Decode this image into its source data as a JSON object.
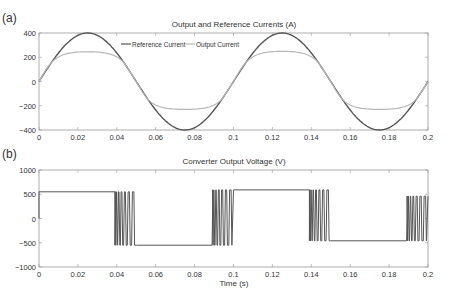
{
  "chart_data": [
    {
      "panel_label": "(a)",
      "type": "line",
      "title": "Output and Reference Currents (A)",
      "xlabel": "",
      "ylabel": "",
      "xlim": [
        0,
        0.2
      ],
      "ylim": [
        -400,
        400
      ],
      "xticks": [
        0,
        0.02,
        0.04,
        0.06,
        0.08,
        0.1,
        0.12,
        0.14,
        0.16,
        0.18,
        0.2
      ],
      "xtick_labels": [
        "0",
        "0.02",
        "0.04",
        "0.06",
        "0.08",
        "0.1",
        "0.12",
        "0.14",
        "0.16",
        "0.18",
        "0.2"
      ],
      "yticks": [
        400,
        200,
        0,
        -200,
        -400
      ],
      "ytick_labels": [
        "400",
        "200",
        "0",
        "−200",
        "−400"
      ],
      "grid": false,
      "legend_position": "upper-left-inside",
      "series": [
        {
          "name": "Reference Current",
          "color": "#555555",
          "description": "sinusoid amplitude 400 A, 10 Hz",
          "x": [
            0,
            0.025,
            0.05,
            0.075,
            0.1,
            0.125,
            0.15,
            0.175,
            0.2
          ],
          "values": [
            0,
            400,
            0,
            -400,
            0,
            400,
            0,
            -400,
            0
          ]
        },
        {
          "name": "Output Current",
          "color": "#b5b5b5",
          "description": "tracks reference but saturates at about ±260 A",
          "x": [
            0,
            0.01,
            0.02,
            0.038,
            0.05,
            0.06,
            0.075,
            0.088,
            0.1,
            0.11,
            0.125,
            0.138,
            0.15,
            0.16,
            0.175,
            0.188,
            0.2
          ],
          "values": [
            0,
            190,
            240,
            260,
            0,
            -180,
            -230,
            -240,
            0,
            190,
            255,
            265,
            0,
            -190,
            -235,
            -240,
            0
          ]
        }
      ]
    },
    {
      "panel_label": "(b)",
      "type": "line",
      "title": "Converter Output Voltage (V)",
      "xlabel": "Time (s)",
      "ylabel": "",
      "xlim": [
        0,
        0.2
      ],
      "ylim": [
        -1000,
        1000
      ],
      "xticks": [
        0,
        0.02,
        0.04,
        0.06,
        0.08,
        0.1,
        0.12,
        0.14,
        0.16,
        0.18,
        0.2
      ],
      "xtick_labels": [
        "0",
        "0.02",
        "0.04",
        "0.06",
        "0.08",
        "0.1",
        "0.12",
        "0.14",
        "0.16",
        "0.18",
        "0.2"
      ],
      "yticks": [
        1000,
        500,
        0,
        -500,
        -1000
      ],
      "ytick_labels": [
        "1000",
        "500",
        "0",
        "−500",
        "−1000"
      ],
      "grid": false,
      "series": [
        {
          "name": "Converter Output Voltage",
          "color": "#555555",
          "description": "square-wave ±550 V with PWM switching bursts near transitions",
          "segments": [
            {
              "t_start": 0.0,
              "t_end": 0.039,
              "level": 550
            },
            {
              "t_start": 0.039,
              "t_end": 0.05,
              "level": "switching"
            },
            {
              "t_start": 0.05,
              "t_end": 0.089,
              "level": -550
            },
            {
              "t_start": 0.089,
              "t_end": 0.1,
              "level": "switching"
            },
            {
              "t_start": 0.1,
              "t_end": 0.139,
              "level": 590
            },
            {
              "t_start": 0.139,
              "t_end": 0.15,
              "level": "switching"
            },
            {
              "t_start": 0.15,
              "t_end": 0.189,
              "level": -460
            },
            {
              "t_start": 0.189,
              "t_end": 0.2,
              "level": "switching"
            }
          ]
        }
      ]
    }
  ],
  "labels": {
    "panel_a": "(a)",
    "panel_b": "(b)",
    "title_a": "Output and Reference Currents (A)",
    "title_b": "Converter Output Voltage (V)",
    "xlabel_b": "Time (s)",
    "legend_ref": "Reference Current",
    "legend_out": "Output Current"
  }
}
